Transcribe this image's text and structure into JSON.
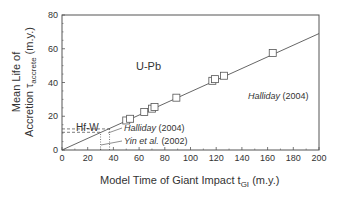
{
  "chart_data": {
    "type": "scatter",
    "title": "",
    "xlabel": "Model Time of Giant Impact t_GI (m.y.)",
    "ylabel": "Mean Life of Accretion τ_accrete (m.y.)",
    "xlim": [
      0,
      200
    ],
    "ylim": [
      0,
      80
    ],
    "xticks": [
      0,
      20,
      40,
      60,
      80,
      100,
      120,
      140,
      160,
      180,
      200
    ],
    "yticks": [
      0,
      20,
      40,
      60,
      80
    ],
    "grid": false,
    "series": [
      {
        "name": "U-Pb (Halliday 2004)",
        "marker": "open-square",
        "x": [
          50,
          53,
          64,
          70,
          72,
          89,
          117,
          119,
          126,
          164
        ],
        "y": [
          17.5,
          18.5,
          22.5,
          24.5,
          25.5,
          31,
          41,
          42,
          44,
          57.5
        ]
      },
      {
        "name": "Fit line",
        "style": "line",
        "x": [
          0,
          200
        ],
        "y": [
          0,
          69
        ]
      }
    ],
    "annotations": [
      {
        "text": "U-Pb",
        "x": 118,
        "y": 50
      },
      {
        "text": "Halliday (2004)",
        "x": 145,
        "y": 37,
        "italic": true
      },
      {
        "text": "Hf-W",
        "x": 11,
        "y": 17
      },
      {
        "text": "Halliday (2004)",
        "x": 41,
        "y": 10,
        "italic": true
      },
      {
        "text": "Yin et al. (2002)",
        "x": 41,
        "y": 3.5,
        "italic": true
      }
    ],
    "reference_lines": [
      {
        "from": [
          0,
          12.5
        ],
        "to": [
          37,
          12.5
        ],
        "style": "dashed"
      },
      {
        "from": [
          0,
          10.5
        ],
        "to": [
          30,
          10.5
        ],
        "style": "dashed"
      },
      {
        "from": [
          37,
          0
        ],
        "to": [
          37,
          12.5
        ],
        "style": "dotted"
      },
      {
        "from": [
          30,
          0
        ],
        "to": [
          30,
          10.5
        ],
        "style": "dotted"
      }
    ]
  },
  "labels": {
    "x_axis": "Model Time of Giant Impact t",
    "x_sub": "GI",
    "x_unit": "(m.y.)",
    "y_line1": "Mean Life of",
    "y_line2": "Accretion τ",
    "y_sub": "accrete",
    "y_unit": "(m.y.)",
    "upb": "U-Pb",
    "hfw": "Hf-W",
    "halliday_upb": "Halliday",
    "halliday_upb_year": "(2004)",
    "halliday_hfw": "Halliday",
    "halliday_hfw_year": "(2004)",
    "yin": "Yin et al.",
    "yin_year": "(2002)"
  }
}
